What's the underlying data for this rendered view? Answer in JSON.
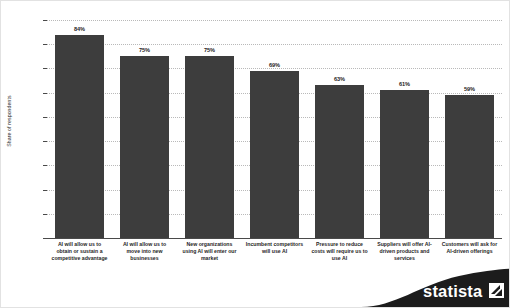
{
  "chart_data": {
    "type": "bar",
    "title": "",
    "subtitle": "",
    "xlabel": "",
    "ylabel": "Share of respondents",
    "ylim": [
      0,
      90
    ],
    "grid": true,
    "legend": "none",
    "orientation": "vertical",
    "bar_color": "#3d3d3d",
    "categories": [
      "AI will allow us to obtain or sustain a competitive advantage",
      "AI will allow us to move into new businesses",
      "New organizations using AI will enter our market",
      "Incumbent competitors will use AI",
      "Pressure to reduce costs will require us to use AI",
      "Suppliers will offer AI-driven products and services",
      "Customers will ask for AI-driven offerings"
    ],
    "category_lines": [
      [
        "AI will allow us to",
        "obtain or sustain a",
        "competitive advantage"
      ],
      [
        "AI will allow us to",
        "move into new",
        "businesses"
      ],
      [
        "New organizations",
        "using AI will enter our",
        "market"
      ],
      [
        "Incumbent competitors",
        "will use AI"
      ],
      [
        "Pressure to reduce",
        "costs will require us to",
        "use AI"
      ],
      [
        "Suppliers will offer AI-",
        "driven products and",
        "services"
      ],
      [
        "Customers will ask for",
        "AI-driven offerings"
      ]
    ],
    "values": [
      84,
      75,
      75,
      69,
      63,
      61,
      59
    ],
    "value_labels": [
      "84%",
      "75%",
      "75%",
      "69%",
      "63%",
      "61%",
      "59%"
    ],
    "ytick_values": [
      0,
      10,
      20,
      30,
      40,
      50,
      60,
      70,
      80,
      90
    ],
    "ytick_labels": [
      "0.0%",
      "10.0%",
      "20.0%",
      "30.0%",
      "40.0%",
      "50.0%",
      "60.0%",
      "70.0%",
      "80.0%",
      "90.0%"
    ]
  },
  "branding": {
    "logo_text": "statista",
    "logo_name": "statista-logo"
  }
}
